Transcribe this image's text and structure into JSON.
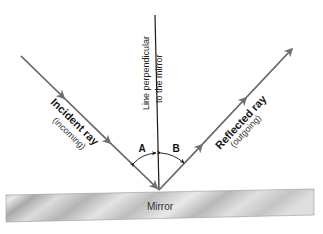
{
  "diagram": {
    "incident_ray": {
      "label": "Incident ray",
      "sublabel": "(incoming)"
    },
    "reflected_ray": {
      "label": "Reflected ray",
      "sublabel": "(outgoing)"
    },
    "normal": {
      "label_line1": "Line perpendicular",
      "label_line2": "to the mirror"
    },
    "angles": {
      "a": "A",
      "b": "B"
    },
    "mirror": {
      "label": "Mirror"
    },
    "colors": {
      "ray": "#6e6e6e",
      "normal": "#1a1a1a",
      "mirror_light": "#e6e6e6",
      "mirror_dark": "#b0b0b0"
    }
  }
}
